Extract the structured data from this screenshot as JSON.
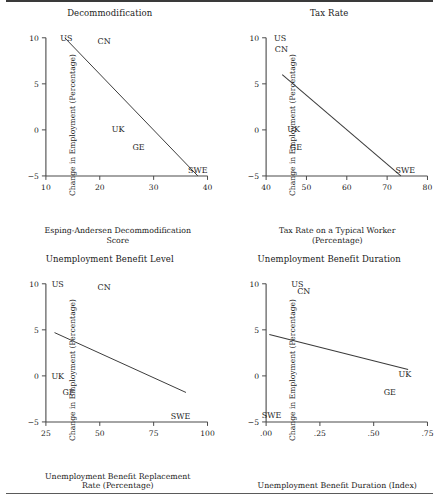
{
  "figure": {
    "top_rule": true,
    "bottom_rule": true,
    "ink_color": "#1a1a1a",
    "axis_color": "#4a4a4a"
  },
  "chart_data": [
    {
      "type": "scatter",
      "title": "Decommodification",
      "xlabel": "Esping-Andersen Decommodification\nScore",
      "xlabel_lines": [
        "Esping-Andersen Decommodification",
        "Score"
      ],
      "ylabel": "Change in Employment (Percentage)",
      "xlim": [
        10,
        40
      ],
      "ylim": [
        -5,
        10
      ],
      "xticks": [
        10,
        20,
        30,
        40
      ],
      "xticklabels": [
        "10",
        "20",
        "30",
        "40"
      ],
      "yticks": [
        -5,
        0,
        5,
        10
      ],
      "yticklabels": [
        "-5",
        "0",
        "5",
        "10"
      ],
      "grid": false,
      "legend": "none",
      "points": [
        {
          "label": "US",
          "x": 13.8,
          "y": 10.0
        },
        {
          "label": "CN",
          "x": 20.8,
          "y": 9.7
        },
        {
          "label": "UK",
          "x": 23.4,
          "y": 0.1
        },
        {
          "label": "GE",
          "x": 27.2,
          "y": -1.9
        },
        {
          "label": "SWE",
          "x": 38.2,
          "y": -4.4
        }
      ],
      "trendline": {
        "x0": 13.5,
        "y0": 10.0,
        "x1": 38.2,
        "y1": -5.0
      }
    },
    {
      "type": "scatter",
      "title": "Tax Rate",
      "xlabel": "Tax Rate on a Typical Worker\n(Percentage)",
      "xlabel_lines": [
        "Tax Rate on a Typical Worker",
        "(Percentage)"
      ],
      "ylabel": "Change in Employment (Percentage)",
      "xlim": [
        40,
        80
      ],
      "ylim": [
        -5,
        10
      ],
      "xticks": [
        40,
        50,
        60,
        70,
        80
      ],
      "xticklabels": [
        "40",
        "50",
        "60",
        "70",
        "80"
      ],
      "yticks": [
        -5,
        0,
        5,
        10
      ],
      "yticklabels": [
        "-5",
        "0",
        "5",
        "10"
      ],
      "grid": false,
      "legend": "none",
      "points": [
        {
          "label": "US",
          "x": 43.5,
          "y": 10.0
        },
        {
          "label": "CN",
          "x": 43.8,
          "y": 8.8
        },
        {
          "label": "UK",
          "x": 46.8,
          "y": 0.1
        },
        {
          "label": "GE",
          "x": 47.4,
          "y": -1.9
        },
        {
          "label": "SWE",
          "x": 74.5,
          "y": -4.4
        }
      ],
      "trendline": {
        "x0": 44.0,
        "y0": 6.0,
        "x1": 73.4,
        "y1": -5.0
      }
    },
    {
      "type": "scatter",
      "title": "Unemployment Benefit Level",
      "xlabel": "Unemployment Benefit Replacement\nRate (Percentage)",
      "xlabel_lines": [
        "Unemployment Benefit Replacement",
        "Rate (Percentage)"
      ],
      "ylabel": "Change in Employment (Percentage)",
      "xlim": [
        25,
        100
      ],
      "ylim": [
        -5,
        10
      ],
      "xticks": [
        25,
        50,
        75,
        100
      ],
      "xticklabels": [
        "25",
        "50",
        "75",
        "100"
      ],
      "yticks": [
        -5,
        0,
        5,
        10
      ],
      "yticklabels": [
        "-5",
        "0",
        "5",
        "10"
      ],
      "grid": false,
      "legend": "none",
      "points": [
        {
          "label": "US",
          "x": 30.5,
          "y": 10.0
        },
        {
          "label": "CN",
          "x": 52.0,
          "y": 9.6
        },
        {
          "label": "UK",
          "x": 30.5,
          "y": 0.0
        },
        {
          "label": "GE",
          "x": 35.5,
          "y": -1.7
        },
        {
          "label": "SWE",
          "x": 87.5,
          "y": -4.4
        }
      ],
      "trendline": {
        "x0": 29.0,
        "y0": 4.7,
        "x1": 90.0,
        "y1": -1.8
      }
    },
    {
      "type": "scatter",
      "title": "Unemployment Benefit Duration",
      "xlabel": "Unemployment Benefit Duration (Index)",
      "xlabel_lines": [
        "Unemployment Benefit Duration (Index)"
      ],
      "ylabel": "Change in Employment (Percentage)",
      "xlim": [
        0.0,
        0.75
      ],
      "ylim": [
        -5,
        10
      ],
      "xticks": [
        0.0,
        0.25,
        0.5,
        0.75
      ],
      "xticklabels": [
        ".00",
        ".25",
        ".50",
        ".75"
      ],
      "yticks": [
        -5,
        0,
        5,
        10
      ],
      "yticklabels": [
        "-5",
        "0",
        "5",
        "10"
      ],
      "grid": false,
      "legend": "none",
      "points": [
        {
          "label": "US",
          "x": 0.145,
          "y": 10.0
        },
        {
          "label": "CN",
          "x": 0.175,
          "y": 9.2
        },
        {
          "label": "UK",
          "x": 0.645,
          "y": 0.2
        },
        {
          "label": "GE",
          "x": 0.575,
          "y": -1.7
        },
        {
          "label": "SWE",
          "x": 0.025,
          "y": -4.3
        }
      ],
      "trendline": {
        "x0": 0.015,
        "y0": 4.5,
        "x1": 0.66,
        "y1": 0.7
      }
    }
  ]
}
